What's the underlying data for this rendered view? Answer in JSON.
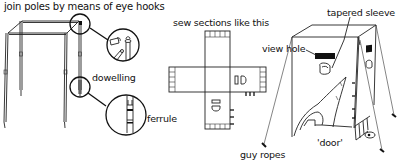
{
  "diagram": {
    "type": "instructional line drawing",
    "panels": [
      {
        "id": "frame",
        "caption": "join poles by means of eye hooks",
        "callouts": [
          "dowelling",
          "ferrule"
        ]
      },
      {
        "id": "pattern",
        "caption": "sew sections like this"
      },
      {
        "id": "assembled-hide",
        "callouts": [
          "view hole",
          "tapered sleeve",
          "'door'",
          "guy ropes"
        ]
      }
    ]
  },
  "labels": {
    "join_poles": "join poles by means of eye hooks",
    "dowelling": "dowelling",
    "ferrule": "ferrule",
    "sew_sections": "sew sections like this",
    "view_hole": "view hole",
    "tapered_sleeve": "tapered sleeve",
    "door": "'door'",
    "guy_ropes": "guy ropes"
  },
  "colors": {
    "ink": "#222222",
    "background": "#ffffff"
  }
}
